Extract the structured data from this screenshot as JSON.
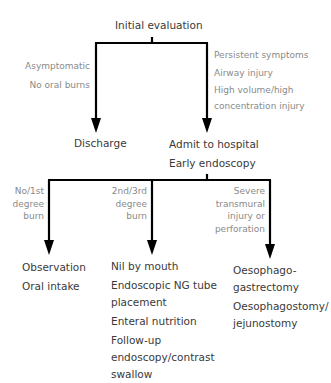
{
  "diagram": {
    "root": {
      "label": "Initial evaluation"
    },
    "branch1": {
      "left": {
        "conditions": [
          "Asymptomatic",
          "No oral burns"
        ],
        "outcome": "Discharge"
      },
      "right": {
        "conditions": [
          "Persistent symptoms",
          "Airway injury",
          "High volume/high",
          "concentration injury"
        ],
        "outcome": [
          "Admit to hospital",
          "Early endoscopy"
        ]
      }
    },
    "branch2": {
      "left": {
        "conditions": [
          "No/1st",
          "degree",
          "burn"
        ],
        "outcome": [
          "Observation",
          "Oral intake"
        ]
      },
      "middle": {
        "conditions": [
          "2nd/3rd",
          "degree",
          "burn"
        ],
        "outcome": [
          "Nil by mouth",
          "Endoscopic NG tube",
          "placement",
          "Enteral nutrition",
          "Follow-up",
          "endoscopy/contrast",
          "swallow"
        ]
      },
      "right": {
        "conditions": [
          "Severe",
          "transmural",
          "injury or",
          "perforation"
        ],
        "outcome": [
          "Oesophago-",
          "gastrectomy",
          "Oesophagostomy/",
          "jejunostomy"
        ]
      }
    },
    "colors": {
      "line": "#000000",
      "node_text": "#3a3a3a",
      "label_text": "#8a8a8a"
    }
  }
}
